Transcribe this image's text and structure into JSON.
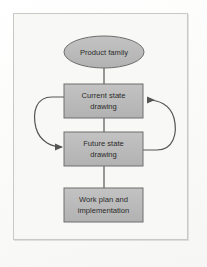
{
  "figure": {
    "background_color": "#f8f8f6",
    "page_color": "#fdfdfc",
    "frame_color": "#c9c9c7",
    "node_fill": "#b9b9b9",
    "node_stroke": "#6e6e6e",
    "connector_color": "#555555",
    "text_color": "#2b2b2b"
  },
  "nodes": {
    "product_family": {
      "shape": "ellipse",
      "lines": [
        "Product family"
      ],
      "cx": 104,
      "cy": 52,
      "rx": 40,
      "ry": 16
    },
    "current_state": {
      "shape": "rect",
      "lines": [
        "Current state",
        "drawing"
      ],
      "x": 64,
      "y": 84,
      "width": 79,
      "height": 34
    },
    "future_state": {
      "shape": "rect",
      "lines": [
        "Future state",
        "drawing"
      ],
      "x": 64,
      "y": 132,
      "width": 79,
      "height": 34
    },
    "work_plan": {
      "shape": "rect",
      "lines": [
        "Work plan and",
        "implementation"
      ],
      "x": 64,
      "y": 188,
      "width": 79,
      "height": 34
    }
  },
  "connectors": [
    {
      "name": "product-family-to-current-state",
      "type": "line",
      "arrowhead": false,
      "from": "product_family",
      "to": "current_state"
    },
    {
      "name": "current-state-to-future-state-line",
      "type": "line",
      "arrowhead": false,
      "from": "current_state",
      "to": "future_state"
    },
    {
      "name": "future-state-to-work-plan",
      "type": "line",
      "arrowhead": false,
      "from": "future_state",
      "to": "work_plan"
    },
    {
      "name": "left-feedback-curve",
      "type": "curve",
      "arrowhead": true,
      "direction": "downward",
      "from": "current_state",
      "to": "future_state",
      "side": "left"
    },
    {
      "name": "right-feedback-curve",
      "type": "curve",
      "arrowhead": true,
      "direction": "upward",
      "from": "future_state",
      "to": "current_state",
      "side": "right"
    }
  ]
}
